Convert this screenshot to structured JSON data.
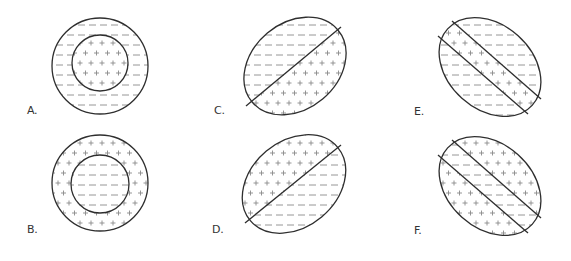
{
  "figure": {
    "background": "#ffffff",
    "outline_color": "#2e2e2e",
    "pattern_color": "#8a8a8a",
    "symbols": {
      "positive": "plus-sign-pattern",
      "negative": "dash-pattern"
    }
  },
  "panels": [
    {
      "id": "A",
      "label": "A.",
      "label_pos": [
        27,
        105
      ],
      "shape": "concentric-circles",
      "outer": {
        "cx": 100,
        "cy": 66,
        "r": 48
      },
      "inner": {
        "cx": 100,
        "cy": 63,
        "r": 28
      },
      "outer_fill": "negative",
      "inner_fill": "positive"
    },
    {
      "id": "B",
      "label": "B.",
      "label_pos": [
        27,
        224
      ],
      "shape": "concentric-circles",
      "outer": {
        "cx": 100,
        "cy": 183,
        "r": 48
      },
      "inner": {
        "cx": 100,
        "cy": 184,
        "r": 29
      },
      "outer_fill": "positive",
      "inner_fill": "negative"
    },
    {
      "id": "C",
      "label": "C.",
      "label_pos": [
        214,
        105
      ],
      "shape": "ellipse-one-divider",
      "ellipse": {
        "cx": 295,
        "cy": 66,
        "rx": 56,
        "ry": 43,
        "rotate": -40
      },
      "lines": [
        [
          246,
          106,
          341,
          27
        ]
      ],
      "regions": [
        "negative-upper-left",
        "positive-lower-right"
      ]
    },
    {
      "id": "D",
      "label": "D.",
      "label_pos": [
        212,
        224
      ],
      "shape": "ellipse-one-divider",
      "ellipse": {
        "cx": 294,
        "cy": 184,
        "rx": 57,
        "ry": 43,
        "rotate": -40
      },
      "lines": [
        [
          245,
          223,
          341,
          145
        ]
      ],
      "regions": [
        "positive-upper-left",
        "negative-lower-right"
      ]
    },
    {
      "id": "E",
      "label": "E.",
      "label_pos": [
        414,
        106
      ],
      "shape": "ellipse-two-dividers",
      "ellipse": {
        "cx": 490,
        "cy": 67,
        "rx": 57,
        "ry": 42,
        "rotate": 42
      },
      "lines": [
        [
          452,
          21,
          541,
          99
        ],
        [
          438,
          36,
          528,
          114
        ]
      ],
      "regions": [
        "negative-outer",
        "positive-band",
        "negative-outer"
      ]
    },
    {
      "id": "F",
      "label": "F.",
      "label_pos": [
        414,
        225
      ],
      "shape": "ellipse-two-dividers",
      "ellipse": {
        "cx": 490,
        "cy": 186,
        "rx": 57,
        "ry": 42,
        "rotate": 42
      },
      "lines": [
        [
          452,
          140,
          541,
          218
        ],
        [
          438,
          155,
          528,
          233
        ]
      ],
      "regions": [
        "positive-outer",
        "negative-band",
        "positive-outer"
      ]
    }
  ]
}
